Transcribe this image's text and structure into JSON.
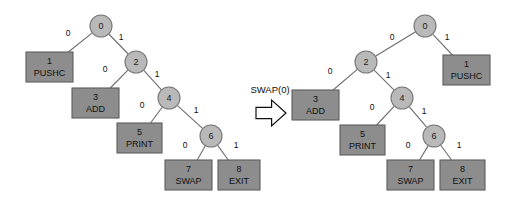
{
  "figure": {
    "background_color": "#ffffff",
    "circle_fill": "#b9b9b9",
    "box_fill": "#8d8d8d",
    "edge_color": "#6d6d6d",
    "text_color": "#101010"
  },
  "operation": {
    "label": "SWAP(0)",
    "arrow_icon": "right-arrow-outline-icon"
  },
  "trees": [
    {
      "id": "before",
      "name": "tree-before",
      "nodes": [
        {
          "id": "n0",
          "kind": "circle",
          "index": "0",
          "instruction": "",
          "cx": 101,
          "cy": 26,
          "r": 11
        },
        {
          "id": "n1",
          "kind": "box",
          "index": "1",
          "instruction": "PUSHC",
          "x": 26,
          "y": 52,
          "w": 47,
          "h": 30
        },
        {
          "id": "n2",
          "kind": "circle",
          "index": "2",
          "instruction": "",
          "cx": 136,
          "cy": 62,
          "r": 11
        },
        {
          "id": "n3",
          "kind": "box",
          "index": "3",
          "instruction": "ADD",
          "x": 72,
          "y": 88,
          "w": 47,
          "h": 30
        },
        {
          "id": "n4",
          "kind": "circle",
          "index": "4",
          "instruction": "",
          "cx": 169,
          "cy": 98,
          "r": 11
        },
        {
          "id": "n5",
          "kind": "box",
          "index": "5",
          "instruction": "PRINT",
          "x": 117,
          "y": 123,
          "w": 45,
          "h": 30
        },
        {
          "id": "n6",
          "kind": "circle",
          "index": "6",
          "instruction": "",
          "cx": 211,
          "cy": 136,
          "r": 11
        },
        {
          "id": "n7",
          "kind": "box",
          "index": "7",
          "instruction": "SWAP",
          "x": 165,
          "y": 160,
          "w": 47,
          "h": 30
        },
        {
          "id": "n8",
          "kind": "box",
          "index": "8",
          "instruction": "EXIT",
          "x": 218,
          "y": 160,
          "w": 42,
          "h": 30
        }
      ],
      "edges": [
        {
          "from": "n0",
          "to": "n1",
          "label": "0",
          "lx": 68,
          "ly": 34
        },
        {
          "from": "n0",
          "to": "n2",
          "label": "1",
          "lx": 121,
          "ly": 38
        },
        {
          "from": "n2",
          "to": "n3",
          "label": "0",
          "lx": 105,
          "ly": 70
        },
        {
          "from": "n2",
          "to": "n4",
          "label": "1",
          "lx": 157,
          "ly": 75
        },
        {
          "from": "n4",
          "to": "n5",
          "label": "0",
          "lx": 142,
          "ly": 106
        },
        {
          "from": "n4",
          "to": "n6",
          "label": "1",
          "lx": 196,
          "ly": 111
        },
        {
          "from": "n6",
          "to": "n7",
          "label": "0",
          "lx": 185,
          "ly": 146
        },
        {
          "from": "n6",
          "to": "n8",
          "label": "1",
          "lx": 236,
          "ly": 146
        }
      ]
    },
    {
      "id": "after",
      "name": "tree-after",
      "nodes": [
        {
          "id": "n0",
          "kind": "circle",
          "index": "0",
          "instruction": "",
          "cx": 425,
          "cy": 26,
          "r": 11
        },
        {
          "id": "n1",
          "kind": "box",
          "index": "1",
          "instruction": "PUSHC",
          "x": 443,
          "y": 55,
          "w": 47,
          "h": 30
        },
        {
          "id": "n2",
          "kind": "circle",
          "index": "2",
          "instruction": "",
          "cx": 366,
          "cy": 62,
          "r": 11
        },
        {
          "id": "n3",
          "kind": "box",
          "index": "3",
          "instruction": "ADD",
          "x": 292,
          "y": 90,
          "w": 47,
          "h": 30
        },
        {
          "id": "n4",
          "kind": "circle",
          "index": "4",
          "instruction": "",
          "cx": 402,
          "cy": 98,
          "r": 11
        },
        {
          "id": "n5",
          "kind": "box",
          "index": "5",
          "instruction": "PRINT",
          "x": 340,
          "y": 125,
          "w": 45,
          "h": 30
        },
        {
          "id": "n6",
          "kind": "circle",
          "index": "6",
          "instruction": "",
          "cx": 434,
          "cy": 136,
          "r": 11
        },
        {
          "id": "n7",
          "kind": "box",
          "index": "7",
          "instruction": "SWAP",
          "x": 387,
          "y": 160,
          "w": 47,
          "h": 30
        },
        {
          "id": "n8",
          "kind": "box",
          "index": "8",
          "instruction": "EXIT",
          "x": 440,
          "y": 160,
          "w": 45,
          "h": 30
        }
      ],
      "edges": [
        {
          "from": "n0",
          "to": "n2",
          "label": "0",
          "lx": 392,
          "ly": 38
        },
        {
          "from": "n0",
          "to": "n1",
          "label": "1",
          "lx": 447,
          "ly": 38
        },
        {
          "from": "n2",
          "to": "n3",
          "label": "0",
          "lx": 330,
          "ly": 72
        },
        {
          "from": "n2",
          "to": "n4",
          "label": "1",
          "lx": 388,
          "ly": 76
        },
        {
          "from": "n4",
          "to": "n5",
          "label": "0",
          "lx": 372,
          "ly": 108
        },
        {
          "from": "n4",
          "to": "n6",
          "label": "1",
          "lx": 424,
          "ly": 112
        },
        {
          "from": "n6",
          "to": "n7",
          "label": "0",
          "lx": 408,
          "ly": 146
        },
        {
          "from": "n6",
          "to": "n8",
          "label": "1",
          "lx": 459,
          "ly": 146
        }
      ]
    }
  ],
  "operation_marker": {
    "text_x": 270,
    "text_y": 90,
    "arrow_x": 256,
    "arrow_y": 100,
    "arrow_w": 30,
    "arrow_h": 26
  }
}
